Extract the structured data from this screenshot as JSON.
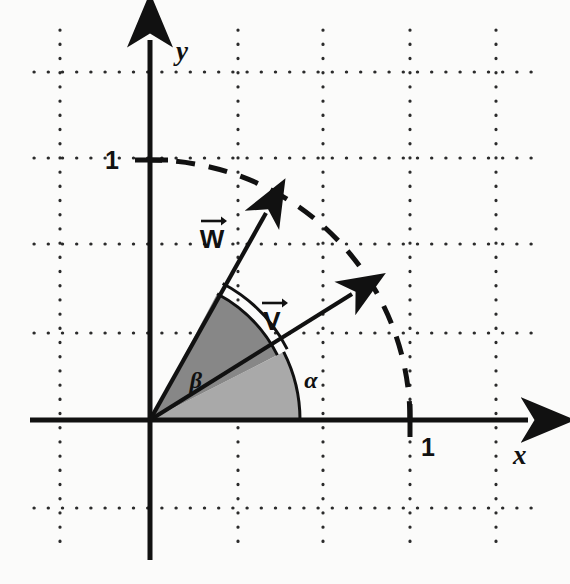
{
  "figure": {
    "background_color": "#fbfbfa",
    "ink_color": "#111111",
    "grid_color": "#2b2b2b"
  },
  "axes": {
    "x_label": "x",
    "y_label": "y",
    "x_tick_label": "1",
    "y_tick_label": "1",
    "origin_px": [
      150,
      420
    ],
    "unit_px": 260,
    "x_axis_y_px": 420,
    "y_axis_x_px": 150
  },
  "grid": {
    "vertical_lines_px": [
      60,
      238,
      323,
      410,
      496
    ],
    "horizontal_lines_px": [
      72,
      158,
      244,
      333,
      508
    ],
    "style": "dotted"
  },
  "vectors": [
    {
      "name": "V",
      "label": "V",
      "arrow_accent": "→",
      "angle_deg": 27,
      "tip_px": [
        360,
        288
      ],
      "label_px": [
        272,
        320
      ]
    },
    {
      "name": "W",
      "label": "W",
      "arrow_accent": "→",
      "angle_deg": 62,
      "tip_px": [
        272,
        205
      ],
      "label_px": [
        212,
        238
      ]
    }
  ],
  "angles": [
    {
      "name": "alpha",
      "label": "α",
      "symbol": "α",
      "from_deg": 0,
      "to_deg": 27,
      "fill_color": "#a9a9a9",
      "radius_px": 150,
      "label_px": [
        311,
        381
      ]
    },
    {
      "name": "beta",
      "label": "β",
      "symbol": "β",
      "from_deg": 27,
      "to_deg": 62,
      "fill_color": "#878787",
      "radius_px": 143,
      "label_px": [
        196,
        380
      ]
    }
  ],
  "arc": {
    "name": "unit-circle-arc",
    "style": "dashed",
    "radius_px": 260,
    "from_deg": 0,
    "to_deg": 90
  }
}
